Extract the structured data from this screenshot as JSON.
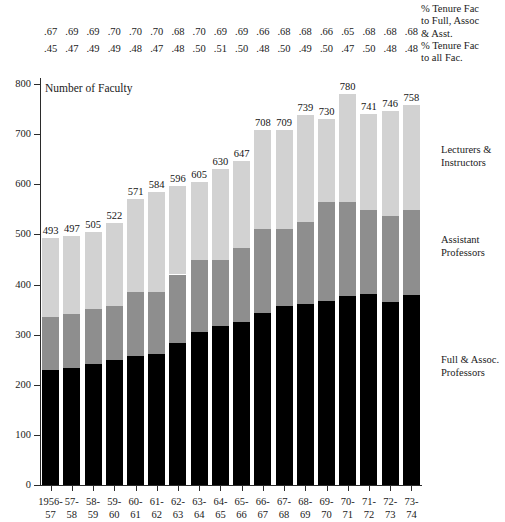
{
  "chart_data": {
    "type": "bar",
    "subtype": "stacked-bar",
    "title": "Number of Faculty",
    "xlabel": "",
    "ylabel": "Number of Faculty",
    "ylim": [
      0,
      800
    ],
    "ytick_step": 100,
    "yticks": [
      "0",
      "100",
      "200",
      "300",
      "400",
      "500",
      "600",
      "700",
      "800"
    ],
    "grid": false,
    "legend_position": "right-inline",
    "categories": [
      "1956-57",
      "57-58",
      "58-59",
      "59-60",
      "60-61",
      "61-62",
      "62-63",
      "63-64",
      "64-65",
      "65-66",
      "66-67",
      "67-68",
      "68-69",
      "69-70",
      "70-71",
      "71-72",
      "72-73",
      "73-74"
    ],
    "category_lines": [
      {
        "l1": "1956-",
        "l2": "57"
      },
      {
        "l1": "57-",
        "l2": "58"
      },
      {
        "l1": "58-",
        "l2": "59"
      },
      {
        "l1": "59-",
        "l2": "60"
      },
      {
        "l1": "60-",
        "l2": "61"
      },
      {
        "l1": "61-",
        "l2": "62"
      },
      {
        "l1": "62-",
        "l2": "63"
      },
      {
        "l1": "63-",
        "l2": "64"
      },
      {
        "l1": "64-",
        "l2": "65"
      },
      {
        "l1": "65-",
        "l2": "66"
      },
      {
        "l1": "66-",
        "l2": "67"
      },
      {
        "l1": "67-",
        "l2": "68"
      },
      {
        "l1": "68-",
        "l2": "69"
      },
      {
        "l1": "69-",
        "l2": "70"
      },
      {
        "l1": "70-",
        "l2": "71"
      },
      {
        "l1": "71-",
        "l2": "72"
      },
      {
        "l1": "72-",
        "l2": "73"
      },
      {
        "l1": "73-",
        "l2": "74"
      }
    ],
    "totals": [
      493,
      497,
      505,
      522,
      571,
      584,
      596,
      605,
      630,
      647,
      708,
      709,
      739,
      730,
      780,
      741,
      746,
      758
    ],
    "series": [
      {
        "name": "Full & Assoc. Professors",
        "color": "#000000",
        "values": [
          229,
          233,
          241,
          250,
          258,
          262,
          283,
          306,
          318,
          325,
          343,
          358,
          362,
          367,
          378,
          381,
          366,
          380
        ]
      },
      {
        "name": "Assistant Professors",
        "color": "#8e8e8e",
        "values": [
          106,
          109,
          110,
          108,
          128,
          124,
          137,
          142,
          131,
          147,
          168,
          153,
          163,
          197,
          187,
          167,
          170,
          169
        ]
      },
      {
        "name": "Lecturers & Instructors",
        "color": "#d2d2d2",
        "values": [
          158,
          155,
          154,
          164,
          185,
          198,
          176,
          157,
          181,
          175,
          197,
          198,
          214,
          166,
          215,
          193,
          210,
          209
        ]
      }
    ],
    "annotations": {
      "tenure_to_full_assoc_asst_label": [
        "% Tenure Fac",
        "to Full, Assoc",
        "& Asst."
      ],
      "tenure_to_all_fac_label": [
        "% Tenure Fac",
        "to all Fac."
      ],
      "tenure_to_full_assoc_asst": [
        ".67",
        ".69",
        ".69",
        ".70",
        ".70",
        ".70",
        ".68",
        ".70",
        ".69",
        ".69",
        ".66",
        ".68",
        ".68",
        ".66",
        ".65",
        ".68",
        ".68",
        ".68"
      ],
      "tenure_to_all_fac": [
        ".45",
        ".47",
        ".49",
        ".49",
        ".48",
        ".47",
        ".48",
        ".50",
        ".51",
        ".50",
        ".48",
        ".50",
        ".49",
        ".50",
        ".47",
        ".50",
        ".48",
        ".48"
      ]
    }
  }
}
